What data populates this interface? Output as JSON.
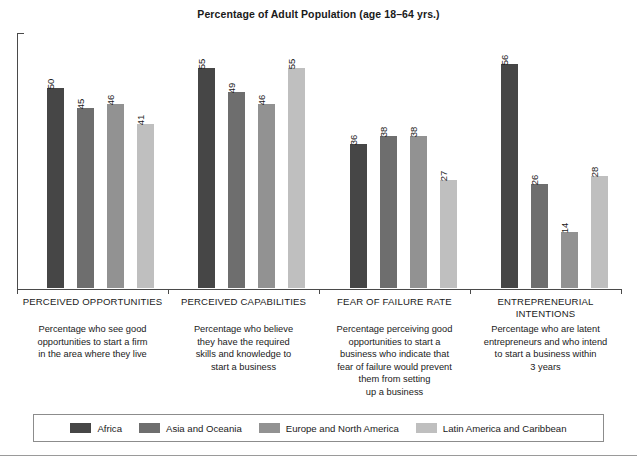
{
  "chart_data": {
    "type": "bar",
    "title": "Percentage of Adult Population (age 18–64 yrs.)",
    "xlabel": "",
    "ylabel": "",
    "ylim": [
      0,
      60
    ],
    "grid": false,
    "legend_position": "bottom",
    "categories": [
      "PERCEIVED OPPORTUNITIES",
      "PERCEIVED CAPABILITIES",
      "FEAR OF FAILURE RATE",
      "ENTREPRENEURIAL INTENTIONS"
    ],
    "category_descriptions": [
      "Percentage who see good opportunities to start a firm in the area where they live",
      "Percentage who believe they have the required skills and knowledge to start a business",
      "Percentage perceiving good opportunities to start a business who indicate that fear of failure would prevent them from setting up a business",
      "Percentage who are latent entrepreneurs and who intend to start a business within 3 years"
    ],
    "series": [
      {
        "name": "Africa",
        "color": "#464646",
        "values": [
          50,
          55,
          36,
          56
        ]
      },
      {
        "name": "Asia and Oceania",
        "color": "#6e6e6e",
        "values": [
          45,
          49,
          38,
          26
        ]
      },
      {
        "name": "Europe and North America",
        "color": "#929292",
        "values": [
          46,
          46,
          38,
          14
        ]
      },
      {
        "name": "Latin America and Caribbean",
        "color": "#bfbfbf",
        "values": [
          41,
          55,
          27,
          28
        ]
      }
    ]
  },
  "groups": [
    {
      "label_lines": [
        "PERCEIVED OPPORTUNITIES"
      ],
      "desc_lines": [
        "Percentage who see good",
        "opportunities to start a firm",
        "in the area where they live"
      ],
      "bars": [
        {
          "series": "Africa",
          "value": 50,
          "color": "#464646"
        },
        {
          "series": "Asia and Oceania",
          "value": 45,
          "color": "#6e6e6e"
        },
        {
          "series": "Europe and North America",
          "value": 46,
          "color": "#929292"
        },
        {
          "series": "Latin America and Caribbean",
          "value": 41,
          "color": "#bfbfbf"
        }
      ]
    },
    {
      "label_lines": [
        "PERCEIVED CAPABILITIES"
      ],
      "desc_lines": [
        "Percentage who believe",
        "they have the required",
        "skills and knowledge to",
        "start a business"
      ],
      "bars": [
        {
          "series": "Africa",
          "value": 55,
          "color": "#464646"
        },
        {
          "series": "Asia and Oceania",
          "value": 49,
          "color": "#6e6e6e"
        },
        {
          "series": "Europe and North America",
          "value": 46,
          "color": "#929292"
        },
        {
          "series": "Latin America and Caribbean",
          "value": 55,
          "color": "#bfbfbf"
        }
      ]
    },
    {
      "label_lines": [
        "FEAR OF FAILURE RATE"
      ],
      "desc_lines": [
        "Percentage perceiving good",
        "opportunities to start a",
        "business who indicate that",
        "fear of failure would prevent",
        "them from setting",
        "up a business"
      ],
      "bars": [
        {
          "series": "Africa",
          "value": 36,
          "color": "#464646"
        },
        {
          "series": "Asia and Oceania",
          "value": 38,
          "color": "#6e6e6e"
        },
        {
          "series": "Europe and North America",
          "value": 38,
          "color": "#929292"
        },
        {
          "series": "Latin America and Caribbean",
          "value": 27,
          "color": "#bfbfbf"
        }
      ]
    },
    {
      "label_lines": [
        "ENTREPRENEURIAL",
        "INTENTIONS"
      ],
      "desc_lines": [
        "Percentage who are latent",
        "entrepreneurs and who intend",
        "to start a business within",
        "3 years"
      ],
      "bars": [
        {
          "series": "Africa",
          "value": 56,
          "color": "#464646"
        },
        {
          "series": "Asia and Oceania",
          "value": 26,
          "color": "#6e6e6e"
        },
        {
          "series": "Europe and North America",
          "value": 14,
          "color": "#929292"
        },
        {
          "series": "Latin America and Caribbean",
          "value": 28,
          "color": "#bfbfbf"
        }
      ]
    }
  ],
  "legend": {
    "items": [
      {
        "label": "Africa",
        "color": "#464646"
      },
      {
        "label": "Asia and Oceania",
        "color": "#6e6e6e"
      },
      {
        "label": "Europe and North America",
        "color": "#929292"
      },
      {
        "label": "Latin America and Caribbean",
        "color": "#bfbfbf"
      }
    ]
  },
  "axis": {
    "color": "#4a4a4a"
  }
}
